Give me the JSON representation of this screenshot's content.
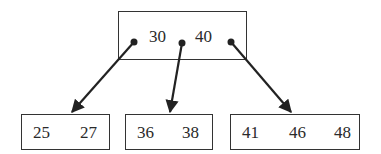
{
  "diagram": {
    "type": "b-tree",
    "root": {
      "keys": [
        "30",
        "40"
      ]
    },
    "leaves": [
      {
        "keys": [
          "25",
          "27"
        ]
      },
      {
        "keys": [
          "36",
          "38"
        ]
      },
      {
        "keys": [
          "41",
          "46",
          "48"
        ]
      }
    ],
    "edges": [
      {
        "from": "root.pointer0",
        "to": "leaves.0"
      },
      {
        "from": "root.pointer1",
        "to": "leaves.1"
      },
      {
        "from": "root.pointer2",
        "to": "leaves.2"
      }
    ],
    "colors": {
      "stroke": "#222222",
      "background": "#ffffff"
    }
  }
}
